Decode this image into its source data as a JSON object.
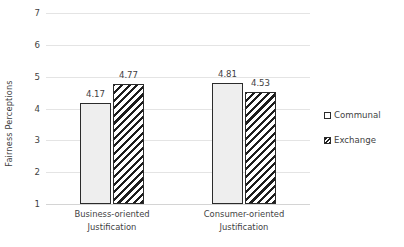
{
  "chart_data": {
    "type": "bar",
    "title": "",
    "subtitle": "",
    "xlabel": "",
    "ylabel": "Fairness Perceptions",
    "ylim": [
      1,
      7
    ],
    "yticks": [
      1,
      2,
      3,
      4,
      5,
      6,
      7
    ],
    "ytick_labels": [
      "1",
      "2",
      "3",
      "4",
      "5",
      "6",
      "7"
    ],
    "grid": true,
    "grid_axis": "y",
    "legend_position": "right",
    "categories": [
      "Business-oriented Justification",
      "Consumer-oriented Justification"
    ],
    "category_lines": [
      [
        "Business-oriented",
        "Justification"
      ],
      [
        "Consumer-oriented",
        "Justification"
      ]
    ],
    "series": [
      {
        "name": "Communal",
        "values": [
          4.17,
          4.81
        ],
        "value_labels": [
          "4.17",
          "4.81"
        ],
        "fill": "#eeeeee",
        "pattern": "solid",
        "edge_color": "#2b2b2b"
      },
      {
        "name": "Exchange",
        "values": [
          4.77,
          4.53
        ],
        "value_labels": [
          "4.77",
          "4.53"
        ],
        "fill": "#ffffff",
        "pattern": "diagonal-hatch",
        "edge_color": "#2b2b2b"
      }
    ],
    "colors": {
      "gridline": "#e4e4e4",
      "baseline": "#d4d4d4",
      "text": "#3f3f3f",
      "bar_edge": "#2b2b2b",
      "communal_fill": "#eeeeee",
      "exchange_hatch": "#1d1d1d",
      "background": "#ffffff"
    }
  },
  "legend": {
    "items": [
      {
        "label": "Communal",
        "swatch": "communal"
      },
      {
        "label": "Exchange",
        "swatch": "exchange"
      }
    ]
  }
}
